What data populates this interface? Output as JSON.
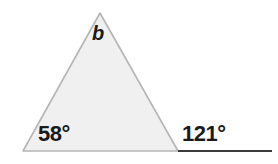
{
  "figure": {
    "kind": "geometry-diagram",
    "background_color": "#ffffff",
    "triangle": {
      "fill_color": "#f0f0f0",
      "stroke_color": "#b5b5b5",
      "stroke_width": 1.6,
      "vertices": {
        "apex": {
          "x": 100,
          "y": 13
        },
        "bottom_left": {
          "x": 23,
          "y": 151
        },
        "bottom_right": {
          "x": 178,
          "y": 151
        }
      }
    },
    "baseline_ray": {
      "stroke_color": "#3a3a3a",
      "stroke_width": 2,
      "from": {
        "x": 178,
        "y": 151
      },
      "to": {
        "x": 272,
        "y": 151
      }
    },
    "labels": {
      "apex_variable": "b",
      "interior_angle_left": "58°",
      "exterior_angle_right": "121°"
    }
  }
}
